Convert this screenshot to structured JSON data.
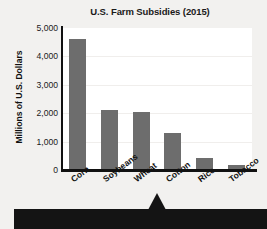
{
  "chart_data": {
    "type": "bar",
    "title": "U.S. Farm Subsidies (2015)",
    "xlabel": "",
    "ylabel": "Millions of U.S. Dollars",
    "categories": [
      "Corn",
      "Soybeans",
      "Wheat",
      "Cotton",
      "Rice",
      "Tobacco"
    ],
    "values": [
      4600,
      2100,
      2030,
      1300,
      420,
      170
    ],
    "ylim": [
      0,
      5000
    ],
    "ytick_labels": [
      "0",
      "1,000",
      "2,000",
      "3,000",
      "4,000",
      "5,000"
    ],
    "ytick_values": [
      0,
      1000,
      2000,
      3000,
      4000,
      5000
    ],
    "grid": true,
    "legend": false,
    "bar_color": "#6d6d6d",
    "axis_color": "#111111",
    "plot_background": "#ffffff",
    "page_background": "#f2f1ef"
  },
  "banner": {
    "background_color": "#141414",
    "badge_icon": "circle-badge-icon",
    "pointer_icon": "triangle-up-icon"
  }
}
